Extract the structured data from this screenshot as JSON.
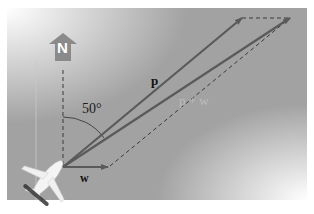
{
  "figure": {
    "north_label": "N",
    "angle_label": "50°",
    "vectors": [
      {
        "name": "p",
        "label": "p"
      },
      {
        "name": "w",
        "label": "w"
      },
      {
        "name": "p_plus_w",
        "label": "p + w"
      }
    ]
  }
}
